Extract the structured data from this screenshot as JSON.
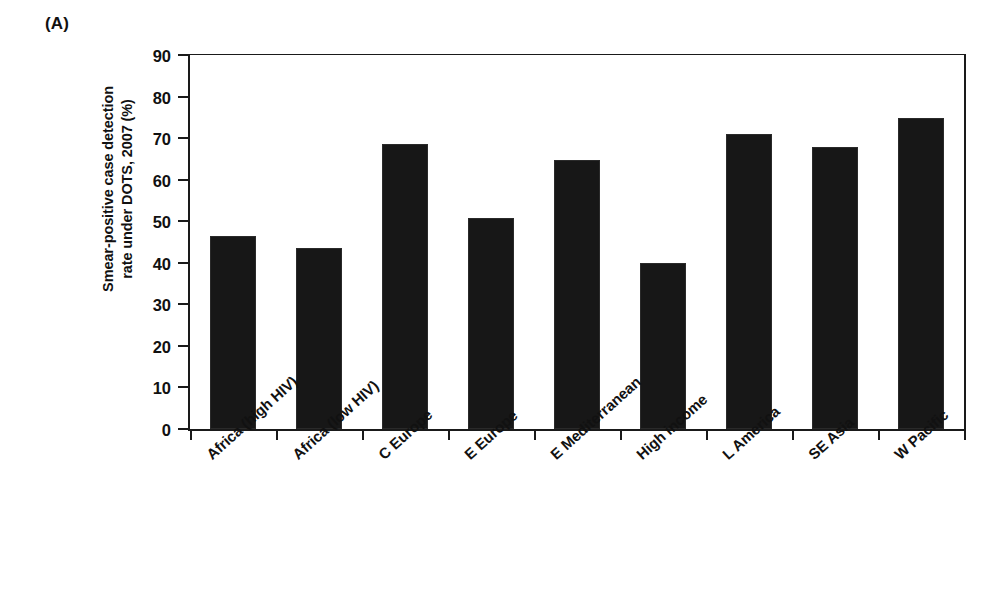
{
  "panel": {
    "label": "(A)"
  },
  "chart_data": {
    "type": "bar",
    "title": "",
    "panel_label": "(A)",
    "xlabel": "",
    "ylabel": "Smear-positive case detection rate under DOTS, 2007 (%)",
    "ylabel_lines": [
      "Smear-positive case detection",
      "rate under DOTS, 2007 (%)"
    ],
    "ylim": [
      0,
      90
    ],
    "ytick_step": 10,
    "ytick_labels": [
      "0",
      "10",
      "20",
      "30",
      "40",
      "50",
      "60",
      "70",
      "80",
      "90"
    ],
    "ytick_values": [
      0,
      10,
      20,
      30,
      40,
      50,
      60,
      70,
      80,
      90
    ],
    "grid": false,
    "legend": false,
    "bar_color": "#171717",
    "axis_color": "#1a1a1a",
    "categories": [
      "Africa (high HIV)",
      "Africa (low HIV)",
      "C Europe",
      "E Europe",
      "E Mediterranean",
      "High income",
      "L America",
      "SE Asia",
      "W Pacific"
    ],
    "values": [
      46.5,
      43.5,
      68.7,
      50.8,
      64.8,
      40.0,
      71.0,
      67.8,
      74.9
    ]
  }
}
